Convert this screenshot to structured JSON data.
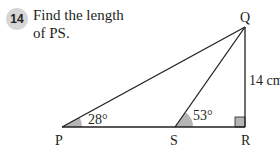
{
  "question": {
    "number": "14",
    "text_line1": "Find the length",
    "text_line2": "of PS."
  },
  "diagram": {
    "vertices": {
      "P": "P",
      "Q": "Q",
      "R": "R",
      "S": "S"
    },
    "angle_P": "28°",
    "angle_S": "53°",
    "side_QR": "14 cm",
    "right_angle_at": "R",
    "colors": {
      "line": "#231f20",
      "angle_fill": "#b5b5b5",
      "badge": "#d6d6d6"
    }
  }
}
